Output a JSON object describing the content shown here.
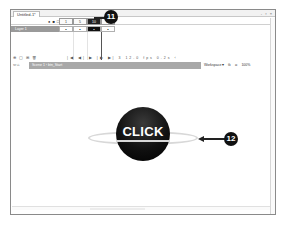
{
  "document": {
    "tab_title": "Untitled-1*",
    "window_controls": "- ▫ ×"
  },
  "timeline": {
    "header_icons": [
      "eye-icon",
      "lock-icon",
      "outline-icon"
    ],
    "header_frames": [
      "1",
      "5",
      "10",
      "15"
    ],
    "layer": {
      "name": "Layer 1",
      "frames": [
        "•",
        "•",
        "•",
        "•"
      ],
      "selected_frame_index": 2
    },
    "footer": {
      "left_icons": "⊕ ▢ ⊞ 🗑",
      "controls": "|◀ ◀| ▶ |▶ ▶|  3  12.0 fps  0.2s  ‹"
    }
  },
  "edit_bar": {
    "nav_icons": "⇦ ⌂",
    "breadcrumbs": [
      "Scene 1",
      "btn_Start"
    ],
    "workspace_label": "Workspace ▾",
    "zoom": "100%"
  },
  "stage": {
    "button_label": "CLICK"
  },
  "callouts": [
    {
      "number": "11",
      "target": "hit-frame"
    },
    {
      "number": "12",
      "target": "hit-area-ring"
    }
  ],
  "colors": {
    "callout": "#111111",
    "button_fill": "#111111",
    "ring": "#d8d8d8",
    "layer_bar": "#9a9a9a",
    "scene_bar": "#a8a8a8"
  }
}
